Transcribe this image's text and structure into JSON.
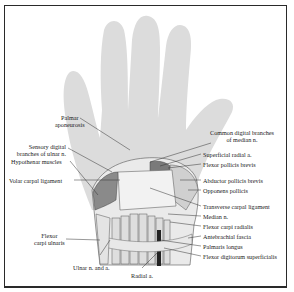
{
  "diagram": {
    "colors": {
      "frame": "#2a2a2a",
      "hand_silhouette": "#dcdcdc",
      "ligament": "#e6e6e6",
      "muscle": "#8a8a8a",
      "leader_line": "#333333"
    },
    "labels_left": [
      {
        "id": "palmar-aponeurosis",
        "line1": "Palmar",
        "line2": "aponeurosis"
      },
      {
        "id": "sensory-digital-branches-ulnar",
        "line1": "Sensory digital",
        "line2": "branches of ulnar n."
      },
      {
        "id": "hypothenar-muscles",
        "line1": "Hypothenar muscles"
      },
      {
        "id": "volar-carpal-ligament",
        "line1": "Volar carpal ligament"
      },
      {
        "id": "flexor-carpi-ulnaris",
        "line1": "Flexor",
        "line2": "carpi ulnaris"
      }
    ],
    "labels_right": [
      {
        "id": "common-digital-branches-median",
        "line1": "Common digital branches",
        "line2": "of median n."
      },
      {
        "id": "superficial-radial-a",
        "line1": "Superficial radial a."
      },
      {
        "id": "flexor-pollicis-brevis",
        "line1": "Flexor pollicis brevis"
      },
      {
        "id": "abductor-pollicis-brevis",
        "line1": "Abductor pollicis brevis"
      },
      {
        "id": "opponens-pollicis",
        "line1": "Opponens pollicis"
      },
      {
        "id": "transverse-carpal-ligament",
        "line1": "Transverse carpal ligament"
      },
      {
        "id": "median-n",
        "line1": "Median n."
      },
      {
        "id": "flexor-carpi-radialis",
        "line1": "Flexor carpi radialis"
      },
      {
        "id": "antebrachial-fascia",
        "line1": "Antebrachial fascia"
      },
      {
        "id": "palmaris-longus",
        "line1": "Palmaris longus"
      },
      {
        "id": "flexor-digitorum-superficialis",
        "line1": "Flexor digitorum superficialis"
      }
    ],
    "labels_bottom": [
      {
        "id": "ulnar-n-and-a",
        "line1": "Ulnar n. and a."
      },
      {
        "id": "radial-a",
        "line1": "Radial a."
      }
    ]
  }
}
